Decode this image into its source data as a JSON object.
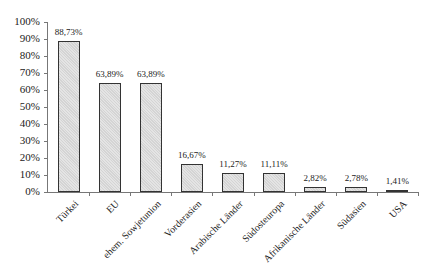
{
  "chart_data": {
    "type": "bar",
    "title": "",
    "xlabel": "",
    "ylabel": "",
    "ylim": [
      0,
      100
    ],
    "yticks": [
      "0%",
      "10%",
      "20%",
      "30%",
      "40%",
      "50%",
      "60%",
      "70%",
      "80%",
      "90%",
      "100%"
    ],
    "categories": [
      "Türkei",
      "EU",
      "ehem. Sowjetunion",
      "Vorderasien",
      "Arabische Länder",
      "Südosteuropa",
      "Afrikanische Länder",
      "Südasien",
      "USA"
    ],
    "values": [
      88.73,
      63.89,
      63.89,
      16.67,
      11.27,
      11.11,
      2.82,
      2.78,
      1.41
    ],
    "value_labels": [
      "88,73%",
      "63,89%",
      "63,89%",
      "16,67%",
      "11,27%",
      "11,11%",
      "2,82%",
      "2,78%",
      "1,41%"
    ],
    "grid": false,
    "legend": null
  }
}
